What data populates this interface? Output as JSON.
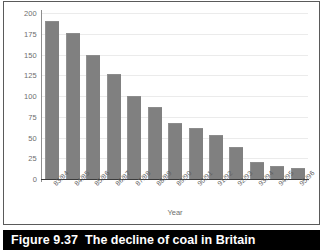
{
  "caption": {
    "label": "Figure 9.37",
    "text": "The decline of coal in Britain"
  },
  "chart_data": {
    "type": "bar",
    "title": "",
    "xlabel": "Year",
    "ylabel": "",
    "ylim": [
      0,
      200
    ],
    "yticks": [
      0,
      25,
      50,
      75,
      100,
      125,
      150,
      175,
      200
    ],
    "grid": true,
    "legend": false,
    "bar_color": "#808080",
    "categories": [
      "83/84",
      "84/85",
      "85/86",
      "86/87",
      "87/88",
      "88/89",
      "89/90",
      "90/91",
      "91/92",
      "92/93",
      "93/94",
      "94/95",
      "95/96"
    ],
    "values": [
      190,
      176,
      150,
      127,
      100,
      87,
      68,
      61,
      53,
      38,
      20,
      16,
      13
    ]
  }
}
